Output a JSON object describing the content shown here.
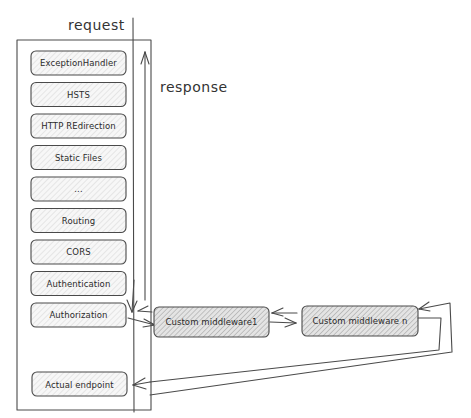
{
  "labels": {
    "request": "request",
    "response": "response"
  },
  "pipeline": [
    {
      "id": "exception-handler",
      "label": "ExceptionHandler"
    },
    {
      "id": "hsts",
      "label": "HSTS"
    },
    {
      "id": "http-redirection",
      "label": "HTTP REdirection"
    },
    {
      "id": "static-files",
      "label": "Static Files"
    },
    {
      "id": "ellipsis",
      "label": "..."
    },
    {
      "id": "routing",
      "label": "Routing"
    },
    {
      "id": "cors",
      "label": "CORS"
    },
    {
      "id": "authentication",
      "label": "Authentication"
    },
    {
      "id": "authorization",
      "label": "Authorization"
    }
  ],
  "custom": [
    {
      "id": "custom-middleware-1",
      "label": "Custom middleware1"
    },
    {
      "id": "custom-middleware-n",
      "label": "Custom middleware n"
    }
  ],
  "endpoint": {
    "label": "Actual endpoint"
  }
}
